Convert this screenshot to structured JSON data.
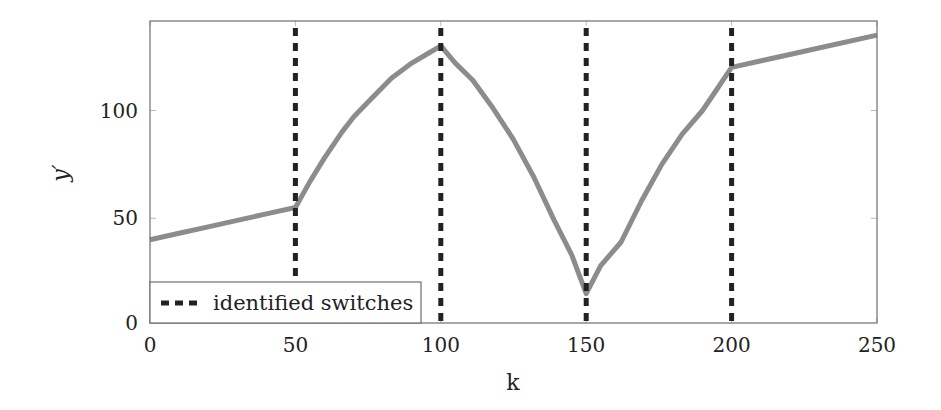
{
  "chart_data": {
    "type": "line",
    "title": "",
    "xlabel": "k",
    "ylabel": "y′",
    "xlim": [
      0,
      250
    ],
    "ylim": [
      0,
      141
    ],
    "grid": false,
    "legend_position": "lower left",
    "x_ticks": [
      0,
      50,
      100,
      150,
      200,
      250
    ],
    "x_tick_labels": [
      "0",
      "50",
      "100",
      "150",
      "200",
      "250"
    ],
    "y_ticks": [
      0,
      50,
      100
    ],
    "y_tick_labels": [
      "0",
      "50",
      "100"
    ],
    "series": [
      {
        "name": "y′",
        "style": "solid",
        "color": "#8c8c8c",
        "in_legend": false,
        "x": [
          0,
          10,
          20,
          30,
          40,
          50,
          55,
          60,
          66,
          70,
          75,
          83,
          90,
          95,
          100,
          105,
          111,
          118,
          125,
          132,
          139,
          145,
          150,
          155,
          162,
          169,
          176,
          183,
          190,
          195,
          200,
          225,
          250
        ],
        "y": [
          40,
          43,
          46,
          49,
          52,
          55,
          67,
          78,
          90,
          97,
          104,
          115,
          122,
          126,
          130,
          122,
          114,
          101,
          86.5,
          69,
          49,
          33,
          15,
          28,
          39,
          58,
          75,
          89,
          100,
          110,
          120,
          127.5,
          135
        ]
      }
    ],
    "vertical_lines": {
      "name": "identified switches",
      "style": "dashed",
      "color": "#222222",
      "in_legend": true,
      "x": [
        50,
        100,
        150,
        200
      ]
    },
    "legend": [
      {
        "label": "identified switches",
        "style": "dashed",
        "color": "#222222"
      }
    ]
  },
  "axes": {
    "x_label": "k",
    "y_label": "y′"
  },
  "legend": {
    "entry_label": "identified switches"
  }
}
